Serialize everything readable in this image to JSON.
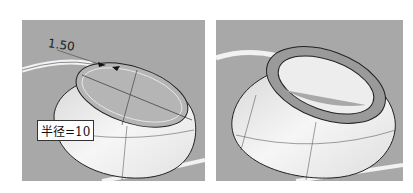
{
  "figure": {
    "left_panel": {
      "dimension_label": "1.50",
      "radius_callout": "半径=10"
    },
    "right_panel": {},
    "colors": {
      "background": "#a8a8a8",
      "surface_light": "#f4f4f4",
      "surface_shade": "#cfcfcf",
      "edge": "#2a2a2a"
    }
  }
}
